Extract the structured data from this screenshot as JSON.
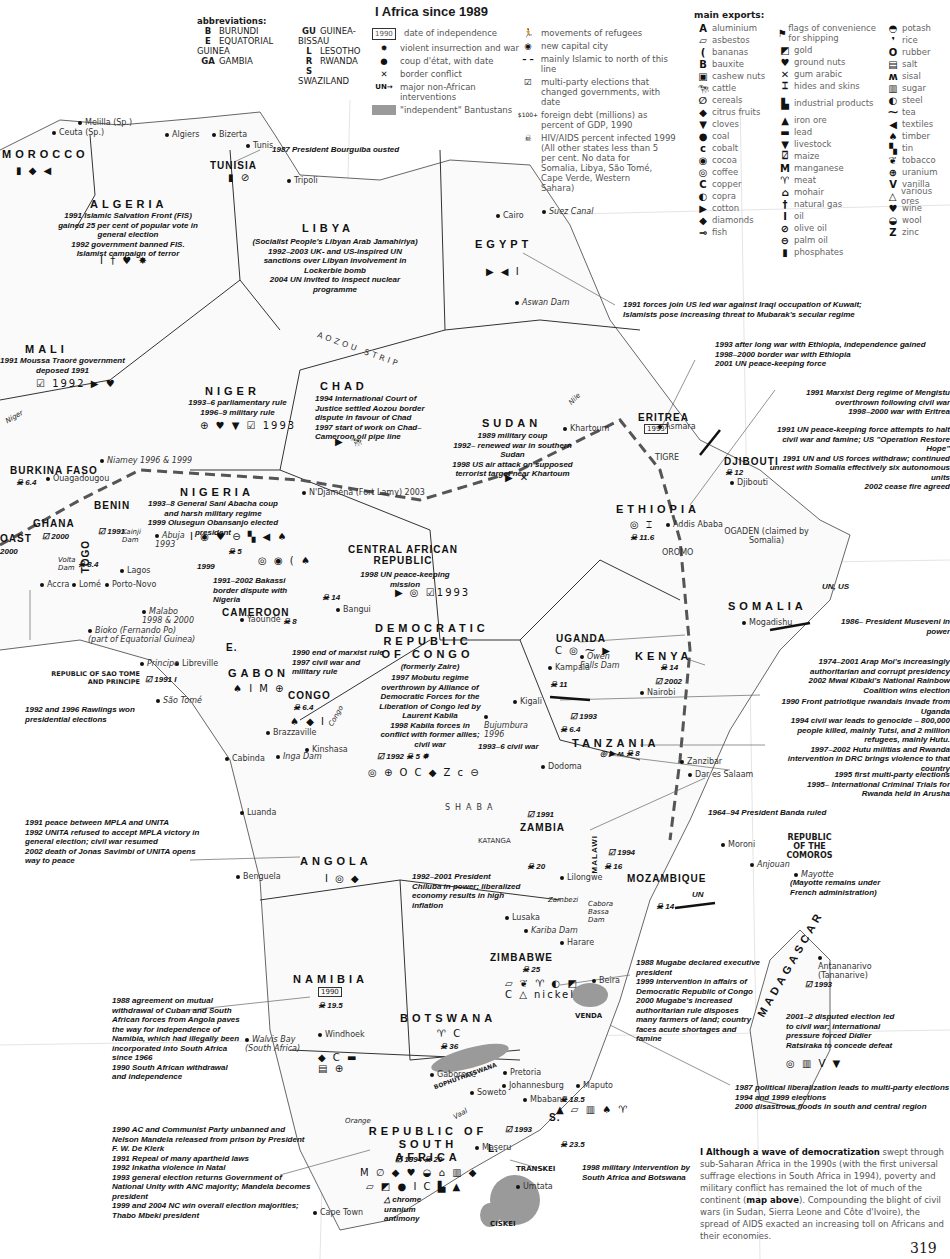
{
  "page": {
    "title": "I Africa since 1989",
    "page_number": "319"
  },
  "abbreviations": {
    "heading": "abbreviations:",
    "items": [
      {
        "code": "B",
        "name": "BURUNDI"
      },
      {
        "code": "E",
        "name": "EQUATORIAL GUINEA"
      },
      {
        "code": "GA",
        "name": "GAMBIA"
      },
      {
        "code": "GU",
        "name": "GUINEA-BISSAU"
      },
      {
        "code": "L",
        "name": "LESOTHO"
      },
      {
        "code": "R",
        "name": "RWANDA"
      },
      {
        "code": "S",
        "name": "SWAZILAND"
      }
    ]
  },
  "legend": {
    "items": [
      {
        "icon": "date-box-icon",
        "glyph": "1990",
        "label": "date of independence"
      },
      {
        "icon": "explosion-icon",
        "glyph": "✸",
        "label": "violent insurrection and war"
      },
      {
        "icon": "coup-dot-icon",
        "glyph": "●",
        "label": "coup d'état, with date"
      },
      {
        "icon": "crossed-swords-icon",
        "glyph": "✕",
        "label": "border conflict"
      },
      {
        "icon": "un-arrow-icon",
        "glyph": "UN→",
        "label": "major non-African interventions"
      },
      {
        "icon": "bantustan-swatch-icon",
        "glyph": "",
        "label": "\"independent\" Bantustans"
      },
      {
        "icon": "refugee-icon",
        "glyph": "🏃",
        "label": "movements of refugees"
      },
      {
        "icon": "new-capital-icon",
        "glyph": "◉",
        "label": "new capital city"
      },
      {
        "icon": "dashed-line-icon",
        "glyph": "– –",
        "label": "mainly Islamic to north of this line"
      },
      {
        "icon": "ballot-box-icon",
        "glyph": "☑",
        "label": "multi-party elections that changed governments, with date"
      },
      {
        "icon": "debt-icon",
        "glyph": "$100+",
        "label": "foreign debt (millions) as percent of GDP, 1990"
      },
      {
        "icon": "skull-icon",
        "glyph": "☠",
        "label": "HIV/AIDS percent infected 1999"
      },
      {
        "icon": "",
        "glyph": "",
        "label": "(All other states less than 5 per cent. No data for Somalia, Libya, São Tomé, Cape Verde, Western Sahara)"
      }
    ]
  },
  "exports": {
    "heading": "main exports:",
    "columns": [
      [
        {
          "g": "A",
          "label": "aluminium"
        },
        {
          "g": "▱",
          "label": "asbestos"
        },
        {
          "g": "(",
          "label": "bananas"
        },
        {
          "g": "B",
          "label": "bauxite"
        },
        {
          "g": "▣",
          "label": "cashew nuts"
        },
        {
          "g": "🐄",
          "label": "cattle"
        },
        {
          "g": "∅",
          "label": "cereals"
        },
        {
          "g": "◆",
          "label": "citrus fruits"
        },
        {
          "g": "▼",
          "label": "cloves"
        },
        {
          "g": "●",
          "label": "coal"
        },
        {
          "g": "c",
          "label": "cobalt"
        },
        {
          "g": "◉",
          "label": "cocoa"
        },
        {
          "g": "◎",
          "label": "coffee"
        },
        {
          "g": "C",
          "label": "copper"
        },
        {
          "g": "◐",
          "label": "copra"
        },
        {
          "g": "▶",
          "label": "cotton"
        },
        {
          "g": "◆",
          "label": "diamonds"
        },
        {
          "g": "⊸",
          "label": "fish"
        }
      ],
      [
        {
          "g": "⚑",
          "label": "flags of convenience for shipping"
        },
        {
          "g": "◩",
          "label": "gold"
        },
        {
          "g": "♥",
          "label": "ground nuts"
        },
        {
          "g": "✕",
          "label": "gum arabic"
        },
        {
          "g": "⌶",
          "label": "hides and skins"
        },
        {
          "g": "▙",
          "label": "industrial products"
        },
        {
          "g": "▲",
          "label": "iron ore"
        },
        {
          "g": "▬",
          "label": "lead"
        },
        {
          "g": "▼",
          "label": "livestock"
        },
        {
          "g": "⍁",
          "label": "maize"
        },
        {
          "g": "M",
          "label": "manganese"
        },
        {
          "g": "♈",
          "label": "meat"
        },
        {
          "g": "⌂",
          "label": "mohair"
        },
        {
          "g": "†",
          "label": "natural gas"
        },
        {
          "g": "I",
          "label": "oil"
        },
        {
          "g": "⊘",
          "label": "olive oil"
        },
        {
          "g": "⊖",
          "label": "palm oil"
        },
        {
          "g": "▮",
          "label": "phosphates"
        }
      ],
      [
        {
          "g": "◓",
          "label": "potash"
        },
        {
          "g": "❜",
          "label": "rice"
        },
        {
          "g": "O",
          "label": "rubber"
        },
        {
          "g": "▤",
          "label": "salt"
        },
        {
          "g": "ʍ",
          "label": "sisal"
        },
        {
          "g": "▥",
          "label": "sugar"
        },
        {
          "g": "◐",
          "label": "steel"
        },
        {
          "g": "⁓",
          "label": "tea"
        },
        {
          "g": "◀",
          "label": "textiles"
        },
        {
          "g": "♠",
          "label": "timber"
        },
        {
          "g": "▚",
          "label": "tin"
        },
        {
          "g": "❦",
          "label": "tobacco"
        },
        {
          "g": "⊕",
          "label": "uranium"
        },
        {
          "g": "V",
          "label": "vanilla"
        },
        {
          "g": "△",
          "label": "various ores"
        },
        {
          "g": "♥",
          "label": "wine"
        },
        {
          "g": "◒",
          "label": "wool"
        },
        {
          "g": "Z",
          "label": "zinc"
        }
      ]
    ]
  },
  "cities": {
    "ceuta": "Ceuta (Sp.)",
    "melilla": "Melilla (Sp.)",
    "algiers": "Algiers",
    "bizerta": "Bizerta",
    "tunis": "Tunis",
    "tripoli": "Tripoli",
    "cairo": "Cairo",
    "suez": "Suez Canal",
    "aswan": "Aswan Dam",
    "khartoum": "Khartoum",
    "asmara": "Asmara",
    "djibouti": "Djibouti",
    "addis": "Addis Ababa",
    "niamey": "Niamey 1996 & 1999",
    "ouaga": "Ouagadougou",
    "ndjamena": "N'Djaména (Fort Lamy) 2003",
    "abuja": "Abuja 1993",
    "accra": "Accra",
    "lome": "Lomé",
    "porto_novo": "Porto-Novo",
    "lagos": "Lagos",
    "malabo": "Malabo 1998 & 2000",
    "bioko": "Bioko (Fernando Po) (part of Equatorial Guinea)",
    "yaounde": "Yaoundé",
    "bangui": "Bangui",
    "libreville": "Libreville",
    "principe": "Principe",
    "sao_tome": "São Tomé",
    "brazzaville": "Brazzaville",
    "kinshasa": "Kinshasa",
    "cabinda": "Cabinda",
    "inga": "Inga Dam",
    "kampala": "Kampala",
    "owen": "Owen Falls Dam",
    "nairobi": "Nairobi",
    "mogadishu": "Mogadishu",
    "kigali": "Kigali",
    "bujumbura": "Bujumbura 1996",
    "dodoma": "Dodoma",
    "zanzibar": "Zanzibar",
    "dar": "Dar es Salaam",
    "luanda": "Luanda",
    "benguela": "Benguela",
    "lusaka": "Lusaka",
    "kariba": "Kariba Dam",
    "lilongwe": "Lilongwe",
    "harare": "Harare",
    "beira": "Beira",
    "moroni": "Moroni",
    "anjouan": "Anjouan",
    "mayotte": "Mayotte",
    "antananarivo": "Antananarivo (Tananarive)",
    "windhoek": "Windhoek",
    "walvis": "Walvis Bay (South Africa)",
    "gaborone": "Gaborone",
    "pretoria": "Pretoria",
    "johannesburg": "Johannesburg",
    "soweto": "Soweto",
    "maputo": "Maputo",
    "mbabane": "Mbabane",
    "maseru": "Maseru",
    "umtata": "Umtata",
    "cape_town": "Cape Town",
    "rabat": "Rabat"
  },
  "regions": {
    "aozou": "AOZOU STRIP",
    "tigre": "TIGRE",
    "oromo": "OROMO",
    "ogaden": "OGADEN (claimed by Somalia)",
    "shaba": "SHABA",
    "katanga": "KATANGA",
    "venda": "VENDA",
    "bophuthatswana": "BOPHUTHATSWANA",
    "transkei": "TRANSKEI",
    "ciskei": "CISKEI",
    "comoros": "REPUBLIC OF THE COMOROS",
    "mayotte_note": "(Mayotte remains under French administration)",
    "nile": "Nile",
    "niger_r": "Niger",
    "congo_r": "Congo",
    "zambezi": "Zambezi",
    "orange": "Orange",
    "vaal": "Vaal",
    "volta": "Volta Dam",
    "kainji": "Kainji Dam",
    "cabora": "Cabora Bassa Dam"
  },
  "countries": {
    "morocco": {
      "name": "MOROCCO",
      "symbols": "▮ ◆ ◀"
    },
    "tunisia": {
      "name": "TUNISIA",
      "symbols": "▮ ⊘",
      "note": "1987 President Bourguiba ousted"
    },
    "algeria": {
      "name": "ALGERIA",
      "note": "1991 Islamic Salvation Front (FIS) gained 25 per cent of popular vote in general election\n1992 government banned FIS. Islamist campaign of terror",
      "symbols": "I † ♥ ✸"
    },
    "libya": {
      "name": "LIBYA",
      "note": "(Socialist People's Libyan Arab Jamahiriya)\n1992–2003 UK- and US-inspired UN sanctions over Libyan involvement in Lockerbie bomb\n2004 UN invited to inspect nuclear programme"
    },
    "egypt": {
      "name": "EGYPT",
      "symbols": "▶ ◀ I",
      "note": "1991 forces join US led war against Iraqi occupation of Kuwait; Islamists pose increasing threat to Mubarak's secular regime"
    },
    "mali": {
      "name": "MALI",
      "note": "1991 Moussa Traoré government deposed 1991",
      "symbols": "☑ 1992 ▶ ♥"
    },
    "niger": {
      "name": "NIGER",
      "note": "1993–6 parliamentary rule\n1996–9 military rule",
      "symbols": "⊕ ♥ ▼ ☑ 1993"
    },
    "chad": {
      "name": "CHAD",
      "note": "1994 International Court of Justice settled Aozou border dispute in favour of Chad\n1997 start of work on Chad–Cameroon oil pipe line",
      "symbols": "▶ 🐄"
    },
    "sudan": {
      "name": "SUDAN",
      "note": "1989 military coup\n1992– renewed war in southern Sudan\n1998 US air attack on supposed terrorist target near Khartoum",
      "symbols": "▶ ✕"
    },
    "eritrea": {
      "name": "ERITREA",
      "date": "1993",
      "note": "1993 after long war with Ethiopia, independence gained\n1998–2000 border war with Ethiopia\n2001 UN peace-keeping force"
    },
    "ethiopia": {
      "name": "ETHIOPIA",
      "symbols": "◎ ⌶",
      "hiv": "11.6",
      "note": "1991 Marxist Derg regime of Mengistu overthrown following civil war\n1998–2000 war with Eritrea"
    },
    "djibouti": {
      "name": "DJIBOUTI",
      "hiv": "12"
    },
    "somalia": {
      "name": "SOMALIA",
      "intervention": "UN, US",
      "note": "1991 UN peace-keeping force attempts to halt civil war and famine; US \"Operation Restore Hope\"\n1991 UN and US forces withdraw; continued unrest with Somalia effectively six autonomous units\n2002 cease fire agreed"
    },
    "burkina": {
      "name": "BURKINA FASO",
      "hiv": "6.4"
    },
    "nigeria": {
      "name": "NIGERIA",
      "note": "1993–8 General Sani Abacha coup and harsh military regime\n1999 Olusegun Obansanjo elected president",
      "symbols": "I ◉ ♥ ⊖ ▚ ◀ ♠",
      "hiv": "5",
      "election": "1999"
    },
    "benin": {
      "name": "BENIN",
      "election": "1991"
    },
    "ghana": {
      "name": "GHANA",
      "election": "2000",
      "note": "1992 and 1996 Rawlings won presidential elections"
    },
    "togo": {
      "name": "TOGO",
      "hiv": "8.4"
    },
    "ivory": {
      "name": "CÔTE D'IVOIRE",
      "label": "OAST",
      "date": "2000"
    },
    "cameroon": {
      "name": "CAMEROON",
      "note": "1991–2002 Bakassi border dispute with Nigeria",
      "hiv": "8",
      "symbols": "◎ ◉ ( ♠"
    },
    "car": {
      "name": "CENTRAL AFRICAN REPUBLIC",
      "note": "1998 UN peace-keeping mission",
      "hiv": "14",
      "election": "1993",
      "symbols": "▶ ◎"
    },
    "drc": {
      "name": "DEMOCRATIC REPUBLIC OF CONGO",
      "sub": "(formerly Zaire)",
      "note": "1997 Mobutu regime overthrown by Alliance of Democratic Forces for the Liberation of Congo led by Laurent Kabila\n1998 Kabila forces in conflict with former allies; civil war",
      "election": "1992",
      "hiv": "5",
      "symbols": "◎ ⊕ O C ◆ Z c ⊖"
    },
    "gabon": {
      "name": "GABON",
      "symbols": "♠ I M ⊕"
    },
    "congo": {
      "name": "CONGO",
      "hiv": "6.4",
      "note": "1990 end of marxist rule\n1997 civil war and military rule",
      "symbols": "♠ ◆ I"
    },
    "sao_tome": {
      "name": "REPUBLIC OF SAO TOME AND PRINCIPE",
      "election": "1991"
    },
    "eq_guinea": {
      "name": "E."
    },
    "uganda": {
      "name": "UGANDA",
      "note": "1986– President Museveni in power",
      "symbols": "C ◎ ⁓ ▶"
    },
    "kenya": {
      "name": "KENYA",
      "hiv": "14",
      "election": "2002",
      "note": "1974–2001 Arap Moi's increasingly authoritarian and corrupt presidency\n2002 Mwai Kibaki's National Rainbow Coalition wins election"
    },
    "rwanda": {
      "name": "R.",
      "hiv": "11",
      "note": "1990 Front patriotique rwandais invade from Uganda\n1994 civil war leads to genocide – 800,000 people killed, mainly Tutsi, and 2 million refugees, mainly Hutu.\n1997–2002 Hutu militias and Rwanda intervention in DRC brings violence to that country"
    },
    "burundi": {
      "name": "B.",
      "note": "1993–6 civil war",
      "election": "1993",
      "hiv": "6.4"
    },
    "tanzania": {
      "name": "TANZANIA",
      "hiv": "8",
      "note": "1995 first multi-party elections\n1995– International Criminal Trials for Rwanda held in Arusha"
    },
    "angola": {
      "name": "ANGOLA",
      "symbols": "I ◎ ◆",
      "note": "1991 peace between MPLA and UNITA\n1992 UNITA refused to accept MPLA victory in general election; civil war resumed\n2002 death of Jonas Savimbi of UNITA opens way to peace"
    },
    "zambia": {
      "name": "ZAMBIA",
      "election": "1991",
      "hiv": "20",
      "note": "1992–2001 President Chiluba in power; liberalized economy results in high inflation"
    },
    "malawi": {
      "name": "MALAWI",
      "election": "1994",
      "hiv": "16",
      "note": "1964–94 President Banda ruled"
    },
    "mozambique": {
      "name": "MOZAMBIQUE",
      "hiv": "14",
      "intervention": "UN",
      "note": "1987 political liberalization leads to multi-party elections\n1994 and 1999 elections\n2000 disastrous floods in south and central region"
    },
    "zimbabwe": {
      "name": "ZIMBABWE",
      "hiv": "25",
      "symbols": "▱ ❦ ♈ ◐ ◩ C △ nickel",
      "note": "1988 Mugabe declared executive president\n1999 intervention in affairs of Democratic Republic of Congo\n2000 Mugabe's increased authoritarian rule disposes many farmers of land; country faces acute shortages and famine"
    },
    "madagascar": {
      "name": "MADAGASCAR",
      "election": "1993",
      "note": "2001–2 disputed election led to civil war; international pressure forced Didier Ratsiraka to concede defeat",
      "symbols": "◎ ▥ V ▼"
    },
    "namibia": {
      "name": "NAMIBIA",
      "date": "1990",
      "hiv": "19.5",
      "symbols": "◆ C ▬ ▤ ⊕",
      "note": "1988 agreement on mutual withdrawal of Cuban and South African forces from Angola paves the way for independence of Namibia, which had illegally been incorporated into South Africa since 1966\n1990 South African withdrawal and independence"
    },
    "botswana": {
      "name": "BOTSWANA",
      "hiv": "36",
      "symbols": "♈ C"
    },
    "swaziland": {
      "name": "S.",
      "hiv": "18.5",
      "symbols": "▲ ▱ ▥ ♠ ♈"
    },
    "lesotho": {
      "name": "L.",
      "election": "1993",
      "hiv": "23.5",
      "note": "1998 military intervention by South Africa and Botswana"
    },
    "south_africa": {
      "name": "REPUBLIC OF SOUTH AFRICA",
      "election": "1994",
      "hiv": "20",
      "symbols1": "M ∅ ◆ ♥ ◒ ⌂ ▥ ◆",
      "symbols2": "▱ ◩ ● I C ▙ ▲",
      "ores": "chrome uranium antimony",
      "note": "1990 AC and Communist Party unbanned and Nelson Mandela released from prison by President F. W. De Klerk\n1991 Repeal of many apartheid laws\n1992 Inkatha violence in Natal\n1993 general election returns Government of National Unity with ANC majority; Mandela becomes president\n1999 and 2004 NC win overall election majorities; Thabo Mbeki president"
    }
  },
  "caption": {
    "lead": "I Although a wave of democratization",
    "text": " swept through sub-Saharan Africa in the 1990s (with the first universal suffrage elections in South Africa in 1994), poverty and military conflict has remained the lot of much of the continent (",
    "bold2": "map above",
    "text2": "). Compounding the blight of civil wars (in Sudan, Sierra Leone and Côte d'Ivoire), the spread of AIDS exacted an increasing toll on Africans and their economies."
  },
  "colors": {
    "bantustan": "#9a9a9a",
    "line": "#555555",
    "text": "#111111"
  }
}
